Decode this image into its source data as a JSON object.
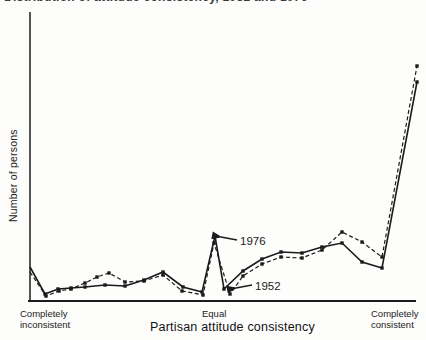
{
  "title": {
    "text": "Distribution of attitude consistency, 1952 and 1976"
  },
  "chart_data": {
    "type": "line",
    "ylabel": "Number of persons",
    "xlabel": "Partisan attitude consistency",
    "y_axis_numeric_labels": "none shown",
    "axis_ticks": {
      "left1": "Completely",
      "left2": "inconsistent",
      "center": "Equal",
      "right1": "Completely",
      "right2": "consistent"
    },
    "line_color": "#1b1b1b",
    "axes": {
      "y": [
        [
          30,
          12
        ],
        [
          30,
          301
        ]
      ],
      "x": [
        [
          28,
          301
        ],
        [
          416,
          301
        ]
      ]
    },
    "series": [
      {
        "name": "1976",
        "style": "solid",
        "points": [
          [
            30,
            267
          ],
          [
            45,
            294
          ],
          [
            58,
            289
          ],
          [
            71,
            288
          ],
          [
            85,
            287
          ],
          [
            105,
            285
          ],
          [
            125,
            286
          ],
          [
            144,
            280
          ],
          [
            163,
            272
          ],
          [
            183,
            287
          ],
          [
            202,
            292
          ],
          [
            215,
            236
          ],
          [
            224,
            289
          ],
          [
            243,
            271
          ],
          [
            262,
            259
          ],
          [
            281,
            252
          ],
          [
            302,
            253
          ],
          [
            322,
            247
          ],
          [
            342,
            243
          ],
          [
            362,
            262
          ],
          [
            382,
            268
          ],
          [
            417,
            82
          ]
        ]
      },
      {
        "name": "1952",
        "style": "dashed",
        "points": [
          [
            30,
            272
          ],
          [
            46,
            296
          ],
          [
            59,
            291
          ],
          [
            71,
            289
          ],
          [
            85,
            283
          ],
          [
            97,
            277
          ],
          [
            109,
            273
          ],
          [
            125,
            282
          ],
          [
            144,
            281
          ],
          [
            163,
            275
          ],
          [
            182,
            291
          ],
          [
            203,
            295
          ],
          [
            214,
            243
          ],
          [
            230,
            294
          ],
          [
            243,
            276
          ],
          [
            262,
            264
          ],
          [
            281,
            257
          ],
          [
            302,
            258
          ],
          [
            322,
            250
          ],
          [
            342,
            232
          ],
          [
            362,
            242
          ],
          [
            382,
            257
          ],
          [
            417,
            66
          ]
        ]
      }
    ],
    "annotations": [
      {
        "label": "1976",
        "text_x": 240,
        "text_y": 245,
        "arrow": [
          [
            237,
            240
          ],
          [
            221,
            237
          ]
        ]
      },
      {
        "label": "1952",
        "text_x": 255,
        "text_y": 290,
        "arrow": [
          [
            252,
            285
          ],
          [
            236,
            288
          ]
        ]
      }
    ]
  }
}
